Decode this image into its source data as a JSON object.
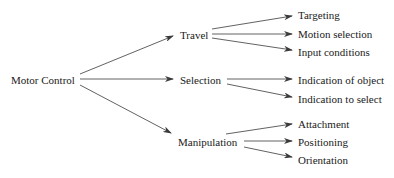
{
  "diagram": {
    "type": "tree",
    "root": {
      "id": "motor",
      "label": "Motor Control"
    },
    "level1": [
      {
        "id": "travel",
        "label": "Travel"
      },
      {
        "id": "selection",
        "label": "Selection"
      },
      {
        "id": "manipulation",
        "label": "Manipulation"
      }
    ],
    "level2": [
      {
        "id": "targeting",
        "parent": "travel",
        "label": "Targeting"
      },
      {
        "id": "motion",
        "parent": "travel",
        "label": "Motion selection"
      },
      {
        "id": "input",
        "parent": "travel",
        "label": "Input conditions"
      },
      {
        "id": "ind_obj",
        "parent": "selection",
        "label": "Indication of object"
      },
      {
        "id": "ind_sel",
        "parent": "selection",
        "label": "Indication to select"
      },
      {
        "id": "attach",
        "parent": "manipulation",
        "label": "Attachment"
      },
      {
        "id": "pos",
        "parent": "manipulation",
        "label": "Positioning"
      },
      {
        "id": "orient",
        "parent": "manipulation",
        "label": "Orientation"
      }
    ],
    "colors": {
      "line": "#3a3a3a",
      "text": "#1a1a1a",
      "background": "#ffffff"
    }
  }
}
